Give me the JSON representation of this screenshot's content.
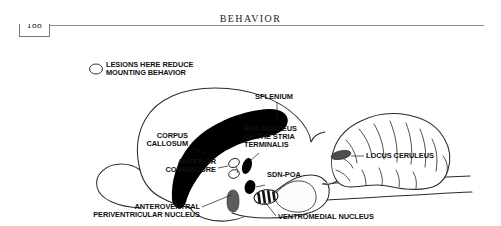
{
  "page": {
    "folio": "188",
    "running_title": "BEHAVIOR"
  },
  "figure": {
    "caption_labels": {
      "lesions": "LESIONS HERE REDUCE\nMOUNTING BEHAVIOR",
      "lesions_line1": "LESIONS HERE REDUCE",
      "lesions_line2": "MOUNTING BEHAVIOR",
      "splenium": "SPLENIUM",
      "corpus_callosum_line1": "CORPUS",
      "corpus_callosum_line2": "CALLOSUM",
      "bnst_line1": "BED NUCLEUS",
      "bnst_line2": "OF THE STRIA",
      "bnst_line3": "TERMINALIS",
      "locus_ceruleus": "LOCUS CERULEUS",
      "anterior_commissure_line1": "ANTERIOR",
      "anterior_commissure_line2": "COMMISSURE",
      "sdn_poa": "SDN-POA",
      "avpv_line1": "ANTEROVENTRAL",
      "avpv_line2": "PERIVENTRICULAR NUCLEUS",
      "ventromedial_nucleus": "VENTROMEDIAL NUCLEUS"
    },
    "structures": [
      {
        "id": "lesion-site",
        "name": "Lesion site marker",
        "style": "open ellipse"
      },
      {
        "id": "corpus-callosum",
        "name": "Corpus callosum",
        "style": "solid black arc"
      },
      {
        "id": "splenium",
        "name": "Splenium",
        "style": "solid black, posterior end of corpus callosum"
      },
      {
        "id": "bed-nucleus-stria-terminalis",
        "name": "Bed nucleus of the stria terminalis",
        "style": "solid black ellipse"
      },
      {
        "id": "anterior-commissure",
        "name": "Anterior commissure",
        "style": "open ellipse"
      },
      {
        "id": "sdn-poa",
        "name": "SDN-POA",
        "style": "solid black ellipse"
      },
      {
        "id": "anteroventral-periventricular-nucleus",
        "name": "Anteroventral periventricular nucleus",
        "style": "gray elongated shape"
      },
      {
        "id": "ventromedial-nucleus",
        "name": "Ventromedial nucleus",
        "style": "striped ellipse"
      },
      {
        "id": "locus-ceruleus",
        "name": "Locus ceruleus",
        "style": "dark gray ellipse"
      },
      {
        "id": "cerebellum",
        "name": "Cerebellum",
        "style": "foliated outline"
      },
      {
        "id": "cerebrum",
        "name": "Cerebral hemisphere",
        "style": "outline"
      },
      {
        "id": "brainstem",
        "name": "Brainstem / spinal cord",
        "style": "outline"
      }
    ],
    "colors": {
      "ink": "#111111",
      "outline": "#2a2a2a",
      "solid": "#000000",
      "gray": "#5c5c5c",
      "paper": "#ffffff",
      "rule": "#8d8d8d"
    }
  }
}
